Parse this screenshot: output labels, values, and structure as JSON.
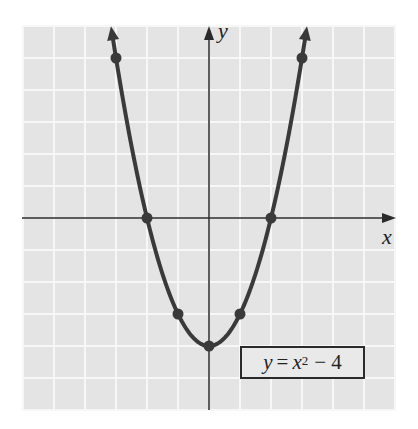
{
  "chart_data": {
    "type": "line",
    "title": "",
    "equation": "y = x^2 - 4",
    "legend": {
      "y_var": "y",
      "eq": "=",
      "x_var": "x",
      "exponent": "2",
      "rest": "− 4"
    },
    "xlabel": "x",
    "ylabel": "y",
    "xlim": [
      -6,
      6
    ],
    "ylim": [
      -6,
      6
    ],
    "grid": true,
    "legend_position": "lower right",
    "series": [
      {
        "name": "y = x^2 - 4",
        "function": "x^2 - 4",
        "plotted_points": [
          {
            "x": -3,
            "y": 5
          },
          {
            "x": -2,
            "y": 0
          },
          {
            "x": -1,
            "y": -3
          },
          {
            "x": 0,
            "y": -4
          },
          {
            "x": 1,
            "y": -3
          },
          {
            "x": 2,
            "y": 0
          },
          {
            "x": 3,
            "y": 5
          }
        ]
      }
    ]
  },
  "layout": {
    "origin_px": [
      209,
      218
    ],
    "unit_x_px": 31,
    "unit_y_px": 32,
    "grid_left": 22,
    "grid_top": 26,
    "grid_right": 396,
    "grid_bottom": 410,
    "grid_bg": "#e4e4e4",
    "grid_line": "#f7f7f7",
    "curve_color": "#3a3a3a",
    "axis_color": "#2a2a2a"
  },
  "labels": {
    "x_axis": "x",
    "y_axis": "y"
  }
}
